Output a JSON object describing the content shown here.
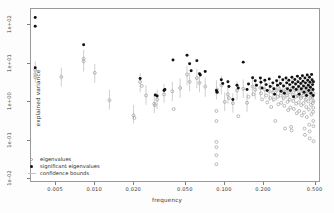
{
  "chart_data": {
    "type": "scatter",
    "title": "",
    "xlabel": "frequency",
    "ylabel": "explained variance",
    "xscale": "log",
    "yscale": "log",
    "xlim": [
      0.0032,
      0.55
    ],
    "ylim": [
      0.008,
      260
    ],
    "grid": false,
    "legend_position": "bottom-left",
    "legend": [
      {
        "label": "eigenvalues",
        "marker": "open-circle",
        "color": "#9e9e9e"
      },
      {
        "label": "significant eigenvalues",
        "marker": "filled-circle",
        "color": "#111111"
      },
      {
        "label": "confidence bounds",
        "marker": "vertical-line",
        "color": "#c2c2c2"
      }
    ],
    "xticks": [
      0.005,
      0.01,
      0.02,
      0.05,
      0.1,
      0.2,
      0.5
    ],
    "xticklabels": [
      "0.005",
      "0.010",
      "0.020",
      "0.050",
      "0.100",
      "0.200",
      "0.500"
    ],
    "yticks": [
      0.01,
      0.1,
      1,
      10,
      100
    ],
    "yticklabels": [
      "1e-02",
      "1e-01",
      "1e+00",
      "1e+01",
      "1e+02"
    ],
    "series": [
      {
        "name": "significant eigenvalues",
        "marker": "filled-circle",
        "color": "#111111",
        "points": [
          [
            0.00345,
            155.0
          ],
          [
            0.00345,
            92.0
          ],
          [
            0.00345,
            7.5
          ],
          [
            0.0082,
            30.0
          ],
          [
            0.0225,
            3.9
          ],
          [
            0.0295,
            1.45
          ],
          [
            0.0305,
            1.35
          ],
          [
            0.0345,
            1.9
          ],
          [
            0.035,
            2.0
          ],
          [
            0.0405,
            12.0
          ],
          [
            0.052,
            16.0
          ],
          [
            0.0545,
            9.5
          ],
          [
            0.056,
            6.2
          ],
          [
            0.062,
            11.5
          ],
          [
            0.065,
            5.2
          ],
          [
            0.066,
            4.8
          ],
          [
            0.072,
            6.0
          ],
          [
            0.088,
            1.9
          ],
          [
            0.089,
            1.7
          ],
          [
            0.096,
            3.6
          ],
          [
            0.0985,
            2.9
          ],
          [
            0.108,
            3.2
          ],
          [
            0.11,
            2.4
          ],
          [
            0.118,
            1.1
          ],
          [
            0.127,
            2.6
          ],
          [
            0.13,
            2.2
          ],
          [
            0.142,
            10.5
          ],
          [
            0.152,
            2.0
          ],
          [
            0.156,
            2.8
          ],
          [
            0.168,
            4.1
          ],
          [
            0.176,
            3.4
          ],
          [
            0.18,
            2.6
          ],
          [
            0.193,
            4.0
          ],
          [
            0.195,
            3.1
          ],
          [
            0.199,
            2.2
          ],
          [
            0.209,
            3.5
          ],
          [
            0.214,
            2.7
          ],
          [
            0.218,
            1.9
          ],
          [
            0.226,
            3.8
          ],
          [
            0.23,
            2.4
          ],
          [
            0.241,
            3.0
          ],
          [
            0.246,
            2.1
          ],
          [
            0.249,
            1.5
          ],
          [
            0.258,
            3.4
          ],
          [
            0.262,
            2.6
          ],
          [
            0.271,
            4.3
          ],
          [
            0.276,
            2.9
          ],
          [
            0.279,
            1.8
          ],
          [
            0.288,
            3.6
          ],
          [
            0.292,
            2.5
          ],
          [
            0.296,
            1.6
          ],
          [
            0.305,
            4.0
          ],
          [
            0.309,
            3.0
          ],
          [
            0.313,
            2.1
          ],
          [
            0.321,
            3.5
          ],
          [
            0.326,
            2.7
          ],
          [
            0.33,
            1.9
          ],
          [
            0.339,
            4.2
          ],
          [
            0.343,
            3.1
          ],
          [
            0.347,
            2.3
          ],
          [
            0.349,
            1.3
          ],
          [
            0.357,
            3.7
          ],
          [
            0.362,
            2.8
          ],
          [
            0.366,
            2.0
          ],
          [
            0.374,
            4.5
          ],
          [
            0.378,
            3.2
          ],
          [
            0.382,
            2.4
          ],
          [
            0.386,
            1.5
          ],
          [
            0.393,
            3.9
          ],
          [
            0.397,
            2.9
          ],
          [
            0.401,
            2.1
          ],
          [
            0.409,
            4.6
          ],
          [
            0.413,
            3.3
          ],
          [
            0.417,
            2.5
          ],
          [
            0.421,
            1.7
          ],
          [
            0.428,
            4.0
          ],
          [
            0.432,
            3.0
          ],
          [
            0.436,
            2.2
          ],
          [
            0.44,
            1.4
          ],
          [
            0.446,
            4.8
          ],
          [
            0.45,
            3.5
          ],
          [
            0.454,
            2.6
          ],
          [
            0.458,
            1.9
          ],
          [
            0.464,
            4.2
          ],
          [
            0.468,
            3.1
          ],
          [
            0.472,
            2.3
          ],
          [
            0.476,
            1.6
          ],
          [
            0.482,
            5.0
          ],
          [
            0.486,
            3.6
          ],
          [
            0.49,
            2.7
          ],
          [
            0.494,
            2.0
          ],
          [
            0.496,
            1.4
          ],
          [
            0.498,
            3.2
          ]
        ]
      },
      {
        "name": "eigenvalues",
        "marker": "open-circle",
        "color": "#9e9e9e",
        "points": [
          [
            0.00345,
            6.5
          ],
          [
            0.00345,
            5.0
          ],
          [
            0.00345,
            4.2
          ],
          [
            0.0055,
            4.3
          ],
          [
            0.0082,
            13.0
          ],
          [
            0.0082,
            11.0
          ],
          [
            0.01,
            5.5
          ],
          [
            0.013,
            1.05
          ],
          [
            0.02,
            0.42
          ],
          [
            0.0203,
            0.36
          ],
          [
            0.0225,
            3.2
          ],
          [
            0.0232,
            2.5
          ],
          [
            0.025,
            1.4
          ],
          [
            0.029,
            0.85
          ],
          [
            0.0293,
            0.78
          ],
          [
            0.0305,
            1.1
          ],
          [
            0.0345,
            1.5
          ],
          [
            0.04,
            1.8
          ],
          [
            0.041,
            0.62
          ],
          [
            0.046,
            2.2
          ],
          [
            0.052,
            5.0
          ],
          [
            0.0545,
            3.2
          ],
          [
            0.062,
            4.0
          ],
          [
            0.065,
            3.0
          ],
          [
            0.072,
            2.4
          ],
          [
            0.088,
            0.55
          ],
          [
            0.088,
            0.3
          ],
          [
            0.088,
            0.085
          ],
          [
            0.088,
            0.062
          ],
          [
            0.088,
            0.038
          ],
          [
            0.088,
            0.022
          ],
          [
            0.089,
            2.0
          ],
          [
            0.089,
            1.7
          ],
          [
            0.096,
            2.6
          ],
          [
            0.102,
            0.95
          ],
          [
            0.108,
            1.5
          ],
          [
            0.11,
            1.2
          ],
          [
            0.118,
            0.88
          ],
          [
            0.127,
            1.9
          ],
          [
            0.13,
            0.4
          ],
          [
            0.142,
            2.1
          ],
          [
            0.152,
            0.9
          ],
          [
            0.156,
            1.3
          ],
          [
            0.168,
            2.4
          ],
          [
            0.17,
            1.5
          ],
          [
            0.176,
            2.0
          ],
          [
            0.193,
            2.2
          ],
          [
            0.195,
            1.6
          ],
          [
            0.199,
            1.1
          ],
          [
            0.209,
            2.0
          ],
          [
            0.214,
            1.4
          ],
          [
            0.218,
            0.92
          ],
          [
            0.226,
            1.8
          ],
          [
            0.23,
            1.2
          ],
          [
            0.234,
            0.7
          ],
          [
            0.241,
            1.7
          ],
          [
            0.246,
            1.1
          ],
          [
            0.252,
            0.3
          ],
          [
            0.258,
            1.9
          ],
          [
            0.262,
            1.3
          ],
          [
            0.266,
            0.82
          ],
          [
            0.271,
            2.1
          ],
          [
            0.276,
            1.4
          ],
          [
            0.28,
            0.9
          ],
          [
            0.288,
            1.8
          ],
          [
            0.292,
            1.2
          ],
          [
            0.296,
            0.75
          ],
          [
            0.3,
            0.19
          ],
          [
            0.305,
            2.0
          ],
          [
            0.309,
            1.4
          ],
          [
            0.313,
            0.95
          ],
          [
            0.317,
            0.58
          ],
          [
            0.321,
            1.7
          ],
          [
            0.326,
            1.1
          ],
          [
            0.33,
            0.68
          ],
          [
            0.334,
            0.21
          ],
          [
            0.337,
            0.17
          ],
          [
            0.339,
            2.2
          ],
          [
            0.343,
            1.5
          ],
          [
            0.347,
            1.0
          ],
          [
            0.351,
            0.62
          ],
          [
            0.357,
            1.9
          ],
          [
            0.362,
            1.3
          ],
          [
            0.366,
            0.85
          ],
          [
            0.37,
            0.48
          ],
          [
            0.374,
            2.1
          ],
          [
            0.378,
            1.4
          ],
          [
            0.382,
            0.92
          ],
          [
            0.386,
            0.55
          ],
          [
            0.393,
            1.8
          ],
          [
            0.397,
            1.2
          ],
          [
            0.401,
            0.78
          ],
          [
            0.405,
            0.42
          ],
          [
            0.409,
            2.0
          ],
          [
            0.413,
            1.4
          ],
          [
            0.417,
            0.88
          ],
          [
            0.421,
            0.5
          ],
          [
            0.425,
            0.19
          ],
          [
            0.428,
            0.13
          ],
          [
            0.43,
            1.7
          ],
          [
            0.434,
            1.1
          ],
          [
            0.438,
            0.7
          ],
          [
            0.442,
            0.38
          ],
          [
            0.446,
            2.1
          ],
          [
            0.45,
            1.5
          ],
          [
            0.454,
            0.98
          ],
          [
            0.458,
            0.6
          ],
          [
            0.462,
            0.24
          ],
          [
            0.465,
            0.16
          ],
          [
            0.466,
            0.105
          ],
          [
            0.468,
            1.8
          ],
          [
            0.472,
            1.2
          ],
          [
            0.476,
            0.8
          ],
          [
            0.48,
            0.45
          ],
          [
            0.484,
            2.0
          ],
          [
            0.488,
            1.3
          ],
          [
            0.492,
            0.88
          ],
          [
            0.495,
            0.52
          ],
          [
            0.497,
            0.3
          ],
          [
            0.498,
            0.22
          ],
          [
            0.499,
            0.088
          ],
          [
            0.4985,
            1.6
          ],
          [
            0.4975,
            1.0
          ],
          [
            0.4965,
            0.66
          ]
        ]
      }
    ],
    "confidence_bounds": {
      "name": "confidence bounds",
      "color": "#c9c9c9",
      "description": "vertical segments spanning lower to upper bound at each frequency",
      "segments": [
        [
          0.00345,
          3.0,
          11.0
        ],
        [
          0.0055,
          2.4,
          7.5
        ],
        [
          0.0082,
          6.0,
          22.0
        ],
        [
          0.01,
          3.0,
          9.5
        ],
        [
          0.013,
          0.6,
          2.0
        ],
        [
          0.02,
          0.26,
          0.8
        ],
        [
          0.0225,
          1.7,
          5.4
        ],
        [
          0.025,
          0.8,
          2.6
        ],
        [
          0.029,
          0.48,
          1.5
        ],
        [
          0.0305,
          0.62,
          2.0
        ],
        [
          0.0345,
          0.9,
          2.8
        ],
        [
          0.04,
          1.0,
          3.2
        ],
        [
          0.046,
          1.2,
          3.9
        ],
        [
          0.052,
          2.6,
          8.5
        ],
        [
          0.0545,
          1.8,
          5.6
        ],
        [
          0.062,
          2.2,
          7.0
        ],
        [
          0.065,
          1.7,
          5.3
        ],
        [
          0.072,
          1.3,
          4.2
        ],
        [
          0.088,
          1.1,
          3.5
        ],
        [
          0.096,
          1.5,
          4.6
        ],
        [
          0.102,
          0.55,
          1.7
        ],
        [
          0.108,
          0.85,
          2.7
        ],
        [
          0.118,
          0.5,
          1.6
        ],
        [
          0.127,
          1.05,
          3.3
        ],
        [
          0.142,
          1.2,
          3.7
        ],
        [
          0.152,
          0.52,
          1.6
        ],
        [
          0.168,
          1.35,
          4.2
        ],
        [
          0.176,
          1.1,
          3.5
        ],
        [
          0.193,
          1.25,
          3.9
        ],
        [
          0.209,
          1.15,
          3.6
        ],
        [
          0.226,
          1.0,
          3.2
        ],
        [
          0.241,
          0.95,
          3.0
        ],
        [
          0.258,
          1.05,
          3.3
        ],
        [
          0.271,
          1.2,
          3.7
        ],
        [
          0.288,
          1.0,
          3.2
        ],
        [
          0.305,
          1.15,
          3.6
        ],
        [
          0.321,
          0.95,
          3.0
        ],
        [
          0.339,
          1.25,
          3.9
        ],
        [
          0.357,
          1.05,
          3.3
        ],
        [
          0.374,
          1.2,
          3.7
        ],
        [
          0.393,
          1.0,
          3.2
        ],
        [
          0.409,
          1.15,
          3.6
        ],
        [
          0.43,
          0.95,
          3.0
        ],
        [
          0.446,
          1.2,
          3.8
        ],
        [
          0.468,
          1.05,
          3.3
        ],
        [
          0.484,
          1.15,
          3.6
        ],
        [
          0.495,
          0.95,
          3.0
        ]
      ]
    }
  }
}
